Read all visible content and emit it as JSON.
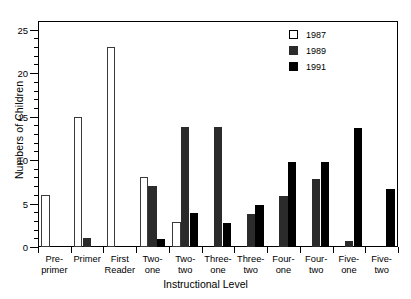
{
  "chart_data": {
    "type": "bar",
    "title": "",
    "xlabel": "Instructional Level",
    "ylabel": "Numbers of Children",
    "ylim": [
      0,
      26
    ],
    "yticks": [
      0,
      5,
      10,
      15,
      20,
      25
    ],
    "ytick_labels": [
      "0",
      "5",
      "10",
      "15",
      "20",
      "25"
    ],
    "minor_tick_interval": 1,
    "grid": false,
    "legend_position": "top-right",
    "categories": [
      "Pre-\nprimer",
      "Primer",
      "First\nReader",
      "Two-\none",
      "Two-\ntwo",
      "Three-\none",
      "Three-\ntwo",
      "Four-\none",
      "Four-\ntwo",
      "Five-\none",
      "Five-\ntwo"
    ],
    "series": [
      {
        "name": "1987",
        "color": "#ffffff",
        "values": [
          6,
          15,
          23,
          8,
          2.9,
          0,
          0,
          0,
          0,
          0,
          0
        ]
      },
      {
        "name": "1989",
        "color": "#2b2b2b",
        "values": [
          0,
          1,
          0,
          7,
          13.8,
          13.8,
          3.8,
          5.9,
          7.8,
          0.7,
          0
        ]
      },
      {
        "name": "1991",
        "color": "#000000",
        "values": [
          0,
          0,
          0,
          0.9,
          3.9,
          2.8,
          4.8,
          9.8,
          9.8,
          13.7,
          6.7
        ]
      }
    ]
  },
  "legend": {
    "items": [
      {
        "label": "1987",
        "swatch": "y1987"
      },
      {
        "label": "1989",
        "swatch": "y1989"
      },
      {
        "label": "1991",
        "swatch": "y1991"
      }
    ]
  }
}
